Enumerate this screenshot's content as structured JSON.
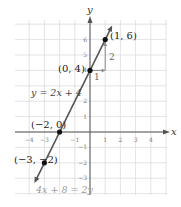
{
  "chart_data": {
    "type": "line",
    "title": "",
    "xlabel": "x",
    "ylabel": "y",
    "xlim": [
      -4,
      4
    ],
    "ylim": [
      -3,
      6
    ],
    "grid": true,
    "x_ticks": [
      -4,
      -3,
      -1,
      1,
      2,
      3,
      4
    ],
    "x_tick_labels": [
      "-4",
      "-3",
      "-1",
      "1",
      "2",
      "3",
      "4"
    ],
    "y_ticks": [
      -3,
      -2,
      -1,
      1,
      2,
      4,
      5,
      6
    ],
    "y_tick_labels": [
      "-3",
      "-2",
      "-1",
      "1",
      "2",
      "4",
      "5",
      "6"
    ],
    "series": [
      {
        "name": "y = 2x + 4",
        "equation": "y = 2x + 4",
        "alt_equation": "4x + 8 = 2y",
        "slope": 2,
        "intercept": 4,
        "x": [
          -3.6,
          1.4
        ],
        "y": [
          -3.2,
          6.8
        ]
      }
    ],
    "points": [
      {
        "x": 1,
        "y": 6,
        "label": "(1, 6)"
      },
      {
        "x": 0,
        "y": 4,
        "label": "(0, 4)"
      },
      {
        "x": -2,
        "y": 0,
        "label": "(−2, 0)"
      },
      {
        "x": -3,
        "y": -2,
        "label": "(−3, −2)"
      }
    ],
    "annotations": [
      {
        "text": "y = 2x + 4",
        "type": "equation-label"
      },
      {
        "text": "4x + 8 = 2y",
        "type": "equation-label"
      },
      {
        "text": "1",
        "type": "run-label"
      },
      {
        "text": "2",
        "type": "rise-label"
      }
    ],
    "slope_triangle": {
      "run": 1,
      "rise": 2,
      "from": [
        0,
        4
      ],
      "to": [
        1,
        6
      ]
    }
  },
  "labels": {
    "x_axis": "x",
    "y_axis": "y",
    "eq1": "y = 2x + 4",
    "eq2": "4x + 8 = 2y",
    "run": "1",
    "rise": "2",
    "p1": "(1, 6)",
    "p2": "(0, 4)",
    "p3": "(−2, 0)",
    "p4": "(−3, −2)"
  },
  "colors": {
    "grid": "#dcdcdc",
    "axis": "#555555",
    "line": "#555555",
    "point": "#111111",
    "triangle": "#8a8a8a",
    "eq2_text": "#9a9a9a"
  }
}
